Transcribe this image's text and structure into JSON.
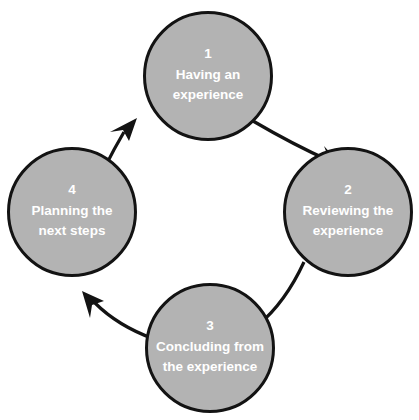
{
  "diagram": {
    "type": "cycle-diagram",
    "direction": "clockwise",
    "colors": {
      "circle_fill": "#b3b3b3",
      "circle_stroke": "#131313",
      "arrow": "#131313",
      "text": "#ffffff",
      "background": "#ffffff"
    },
    "nodes": [
      {
        "number": "1",
        "line1": "Having an",
        "line2": "experience",
        "position": "top",
        "cx": 208,
        "cy": 76,
        "r": 64
      },
      {
        "number": "2",
        "line1": "Reviewing the",
        "line2": "experience",
        "position": "right",
        "cx": 348,
        "cy": 212,
        "r": 64
      },
      {
        "number": "3",
        "line1": "Concluding from",
        "line2": "the experience",
        "position": "bottom",
        "cx": 210,
        "cy": 348,
        "r": 64
      },
      {
        "number": "4",
        "line1": "Planning the",
        "line2": "next steps",
        "position": "left",
        "cx": 72,
        "cy": 212,
        "r": 64
      }
    ],
    "arrows": [
      {
        "from": "1",
        "to": "2",
        "label": "arrow-1-to-2"
      },
      {
        "from": "2",
        "to": "3",
        "label": "arrow-2-to-3"
      },
      {
        "from": "3",
        "to": "4",
        "label": "arrow-3-to-4"
      },
      {
        "from": "4",
        "to": "1",
        "label": "arrow-4-to-1"
      }
    ]
  }
}
